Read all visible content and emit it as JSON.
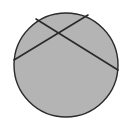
{
  "diagram": {
    "type": "circle-with-intersecting-chords",
    "background": "#ffffff",
    "circle": {
      "cx": 66,
      "cy": 65,
      "r": 52,
      "fill": "#b4b4b4",
      "stroke": "#2a2a2a",
      "stroke_width": 1.4
    },
    "chords": [
      {
        "id": "chord-1",
        "x1": 36,
        "y1": 19,
        "x2": 118,
        "y2": 70,
        "stroke": "#2a2a2a",
        "stroke_width": 1.6
      },
      {
        "id": "chord-2",
        "x1": 14,
        "y1": 60,
        "x2": 88,
        "y2": 15,
        "stroke": "#2a2a2a",
        "stroke_width": 1.6
      }
    ]
  }
}
